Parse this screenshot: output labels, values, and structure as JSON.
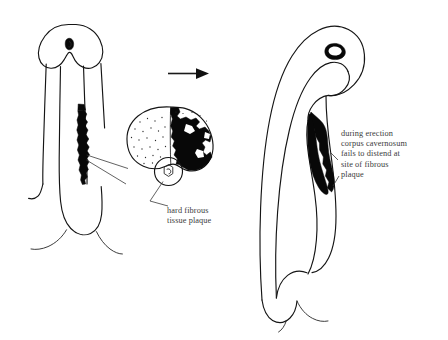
{
  "figure": {
    "background_color": "#ffffff",
    "ink_color": "#151515",
    "plaque_color": "#080808",
    "text_color": "#3b3b3b",
    "panels": [
      {
        "name": "flaccid-penis",
        "description": "Line drawing of flaccid penis, ventral view, with black fibrous plaque along right side of shaft"
      },
      {
        "name": "cross-section-inset",
        "description": "Circular cross-section of penile shaft showing stippled corpus cavernosum on left, black fibrous plaque filling right corpus cavernosum, and small urethra circle below"
      },
      {
        "name": "erect-penis",
        "description": "Line drawing of erect penis curving to the right, with black fibrous plaque at the bend"
      }
    ]
  },
  "arrow": {
    "name": "progression-arrow",
    "direction": "right",
    "from_panel": "flaccid-penis",
    "to_panel": "erect-penis"
  },
  "labels": {
    "plaque": {
      "text": "hard fibrous\ntissue plaque",
      "lines": [
        "hard fibrous",
        "tissue plaque"
      ],
      "points_to": "cross-section-inset"
    },
    "erection": {
      "text": "during erection\ncorpus cavernosum\nfails to distend at\nsite of fibrous\nplaque",
      "lines": [
        "during erection",
        "corpus cavernosum",
        "fails to distend at",
        "site of fibrous",
        "plaque"
      ],
      "points_to": "erect-penis"
    }
  }
}
